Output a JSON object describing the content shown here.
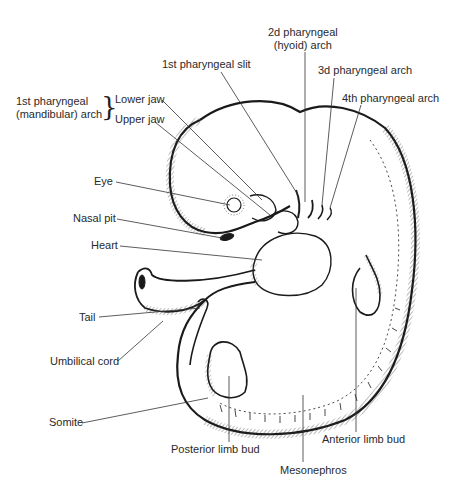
{
  "diagram": {
    "labels": {
      "second_arch_line1": "2d pharyngeal",
      "second_arch_line2": "(hyoid) arch",
      "first_slit": "1st pharyngeal slit",
      "third_arch": "3d pharyngeal arch",
      "fourth_arch": "4th pharyngeal arch",
      "first_arch_line1": "1st pharyngeal",
      "first_arch_line2": "(mandibular) arch",
      "lower_jaw": "Lower jaw",
      "upper_jaw": "Upper jaw",
      "eye": "Eye",
      "nasal_pit": "Nasal pit",
      "heart": "Heart",
      "tail": "Tail",
      "umbilical_cord": "Umbilical cord",
      "somite": "Somite",
      "posterior_limb_bud": "Posterior limb bud",
      "mesonephros": "Mesonephros",
      "anterior_limb_bud": "Anterior limb bud"
    },
    "brace_glyph": "}",
    "colors": {
      "ink": "#1a1a1a",
      "label": "#2a2a2a",
      "background": "#ffffff"
    }
  }
}
